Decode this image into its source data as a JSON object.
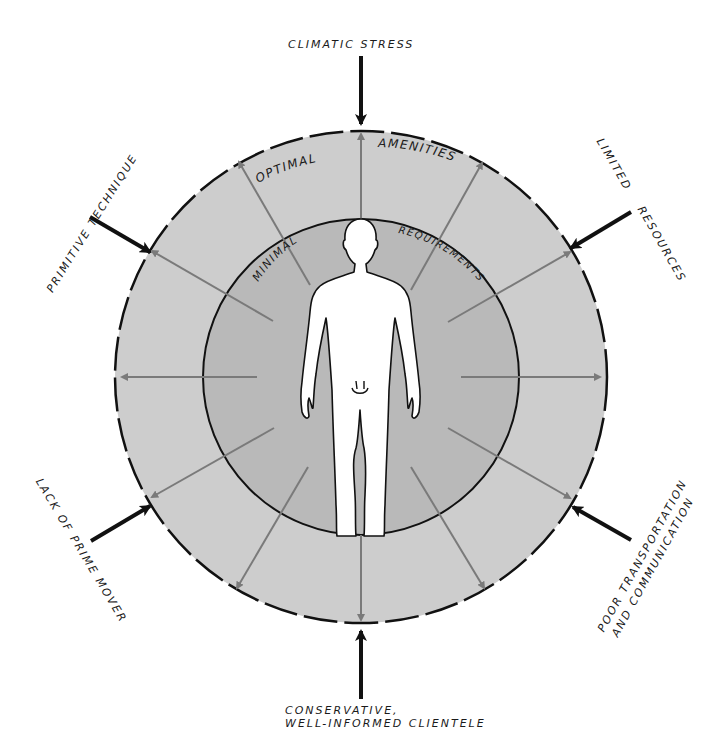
{
  "diagram": {
    "center": [
      361,
      377
    ],
    "outer_radius": 246,
    "inner_radius": 158,
    "colors": {
      "outer_ring": "#cdcdcd",
      "inner_disc": "#b9b9b9",
      "figure": "#ffffff",
      "outline": "#111111",
      "gray_arrow": "#7a7a7a",
      "black_arrow": "#111111"
    },
    "ring_labels": {
      "outer_left": "OPTIMAL",
      "outer_right": "AMENITIES",
      "inner_left": "MINIMAL",
      "inner_right": "REQUIREMENTS"
    },
    "constraints": [
      {
        "id": "top",
        "label": "CLIMATIC STRESS"
      },
      {
        "id": "upper-left",
        "label": "PRIMITIVE TECHNIQUE"
      },
      {
        "id": "upper-right-1",
        "label": "LIMITED"
      },
      {
        "id": "upper-right-2",
        "label": "RESOURCES"
      },
      {
        "id": "lower-left",
        "label": "LACK OF PRIME MOVER"
      },
      {
        "id": "lower-right-1",
        "label": "POOR TRANSPORTATION"
      },
      {
        "id": "lower-right-2",
        "label": "AND COMMUNICATION"
      },
      {
        "id": "bottom-1",
        "label": "CONSERVATIVE,"
      },
      {
        "id": "bottom-2",
        "label": "WELL-INFORMED CLIENTELE"
      }
    ]
  }
}
